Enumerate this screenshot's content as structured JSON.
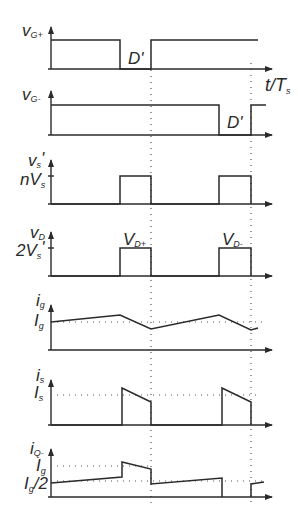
{
  "diagram": {
    "time_axis_label": "t/T",
    "time_axis_sub": "s",
    "panels": [
      {
        "id": "vg_plus",
        "ylabel": "v",
        "ylabel_sub": "G+",
        "annotation": "D'"
      },
      {
        "id": "vg_minus",
        "ylabel": "v",
        "ylabel_sub": "G-",
        "annotation": "D'"
      },
      {
        "id": "vs_prime",
        "ylabel": "v",
        "ylabel_sub": "s",
        "ylabel_suffix": "'",
        "level_label": "nV",
        "level_sub": "s"
      },
      {
        "id": "vd",
        "ylabel": "v",
        "ylabel_sub": "D",
        "level_label": "2V",
        "level_sub": "s",
        "level_suffix": "'",
        "pulse1_label": "V",
        "pulse1_sub": "D+",
        "pulse2_label": "V",
        "pulse2_sub": "D-"
      },
      {
        "id": "ig",
        "ylabel": "i",
        "ylabel_sub": "g",
        "level_label": "I",
        "level_sub": "g"
      },
      {
        "id": "is",
        "ylabel": "i",
        "ylabel_sub": "s",
        "level_label": "I",
        "level_sub": "s"
      },
      {
        "id": "iq_minus",
        "ylabel": "i",
        "ylabel_sub": "Q-",
        "level1_label": "I",
        "level1_sub": "g",
        "level2_label": "I",
        "level2_sub": "g",
        "level2_suffix": "/2"
      }
    ]
  }
}
